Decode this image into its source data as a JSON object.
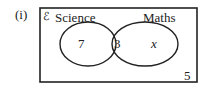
{
  "part_label": "(i)",
  "diagram": {
    "type": "venn",
    "universal_symbol": "ℰ",
    "sets": [
      {
        "name": "Science"
      },
      {
        "name": "Maths"
      }
    ],
    "regions": {
      "science_only": "7",
      "both": "3",
      "maths_only": "x",
      "neither": "5"
    }
  }
}
